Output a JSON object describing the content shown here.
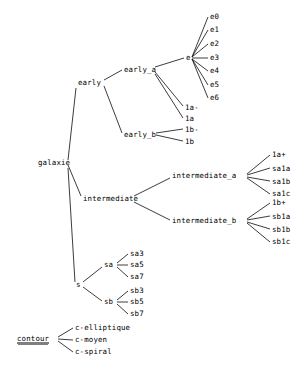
{
  "diagram": {
    "type": "node-link-tree",
    "orientation": "left-to-right",
    "background_color": "#ffffff",
    "edge_color": "#1a1a1a",
    "text_color": "#000000",
    "width": 304,
    "height": 375
  },
  "nodes": [
    {
      "id": "galaxie",
      "label": "galaxie",
      "x": 38,
      "y": 163,
      "anchor": "start",
      "underlined": false
    },
    {
      "id": "early",
      "label": "early",
      "x": 78,
      "y": 83,
      "anchor": "start",
      "underlined": false
    },
    {
      "id": "early_a",
      "label": "early_a",
      "x": 124,
      "y": 70,
      "anchor": "start",
      "underlined": false
    },
    {
      "id": "early_b",
      "label": "early_b",
      "x": 124,
      "y": 135,
      "anchor": "start",
      "underlined": false
    },
    {
      "id": "e",
      "label": "e",
      "x": 186,
      "y": 58,
      "anchor": "start",
      "underlined": false
    },
    {
      "id": "e0",
      "label": "e0",
      "x": 210,
      "y": 17,
      "anchor": "start",
      "underlined": false
    },
    {
      "id": "e1",
      "label": "e1",
      "x": 210,
      "y": 30,
      "anchor": "start",
      "underlined": false
    },
    {
      "id": "e2",
      "label": "e2",
      "x": 210,
      "y": 44,
      "anchor": "start",
      "underlined": false
    },
    {
      "id": "e3",
      "label": "e3",
      "x": 210,
      "y": 58,
      "anchor": "start",
      "underlined": false
    },
    {
      "id": "e4",
      "label": "e4",
      "x": 210,
      "y": 71,
      "anchor": "start",
      "underlined": false
    },
    {
      "id": "e5",
      "label": "e5",
      "x": 210,
      "y": 85,
      "anchor": "start",
      "underlined": false
    },
    {
      "id": "e6",
      "label": "e6",
      "x": 210,
      "y": 98,
      "anchor": "start",
      "underlined": false
    },
    {
      "id": "1a-",
      "label": "1a-",
      "x": 185,
      "y": 108,
      "anchor": "start",
      "underlined": false
    },
    {
      "id": "1a",
      "label": "1a",
      "x": 185,
      "y": 119,
      "anchor": "start",
      "underlined": false
    },
    {
      "id": "1b-",
      "label": "1b-",
      "x": 185,
      "y": 130,
      "anchor": "start",
      "underlined": false
    },
    {
      "id": "1b",
      "label": "1b",
      "x": 185,
      "y": 142,
      "anchor": "start",
      "underlined": false
    },
    {
      "id": "intermediate",
      "label": "intermediate",
      "x": 83,
      "y": 199,
      "anchor": "start",
      "underlined": false
    },
    {
      "id": "intermediate_a",
      "label": "intermediate_a",
      "x": 172,
      "y": 176,
      "anchor": "start",
      "underlined": false
    },
    {
      "id": "intermediate_b",
      "label": "intermediate_b",
      "x": 172,
      "y": 221,
      "anchor": "start",
      "underlined": false
    },
    {
      "id": "1a+",
      "label": "1a+",
      "x": 272,
      "y": 155,
      "anchor": "start",
      "underlined": false
    },
    {
      "id": "sa1a",
      "label": "sa1a",
      "x": 272,
      "y": 169,
      "anchor": "start",
      "underlined": false
    },
    {
      "id": "sa1b",
      "label": "sa1b",
      "x": 272,
      "y": 182,
      "anchor": "start",
      "underlined": false
    },
    {
      "id": "sa1c",
      "label": "sa1c",
      "x": 272,
      "y": 194,
      "anchor": "start",
      "underlined": false
    },
    {
      "id": "1b+",
      "label": "1b+",
      "x": 272,
      "y": 203,
      "anchor": "start",
      "underlined": false
    },
    {
      "id": "sb1a",
      "label": "sb1a",
      "x": 272,
      "y": 217,
      "anchor": "start",
      "underlined": false
    },
    {
      "id": "sb1b",
      "label": "sb1b",
      "x": 272,
      "y": 230,
      "anchor": "start",
      "underlined": false
    },
    {
      "id": "sb1c",
      "label": "sb1c",
      "x": 272,
      "y": 242,
      "anchor": "start",
      "underlined": false
    },
    {
      "id": "s",
      "label": "s",
      "x": 76,
      "y": 285,
      "anchor": "start",
      "underlined": false
    },
    {
      "id": "sa",
      "label": "sa",
      "x": 104,
      "y": 265,
      "anchor": "start",
      "underlined": false
    },
    {
      "id": "sb",
      "label": "sb",
      "x": 104,
      "y": 302,
      "anchor": "start",
      "underlined": false
    },
    {
      "id": "sa3",
      "label": "sa3",
      "x": 130,
      "y": 254,
      "anchor": "start",
      "underlined": false
    },
    {
      "id": "sa5",
      "label": "sa5",
      "x": 130,
      "y": 265,
      "anchor": "start",
      "underlined": false
    },
    {
      "id": "sa7",
      "label": "sa7",
      "x": 130,
      "y": 277,
      "anchor": "start",
      "underlined": false
    },
    {
      "id": "sb3",
      "label": "sb3",
      "x": 130,
      "y": 291,
      "anchor": "start",
      "underlined": false
    },
    {
      "id": "sb5",
      "label": "sb5",
      "x": 130,
      "y": 302,
      "anchor": "start",
      "underlined": false
    },
    {
      "id": "sb7",
      "label": "sb7",
      "x": 130,
      "y": 314,
      "anchor": "start",
      "underlined": false
    },
    {
      "id": "contour",
      "label": "contour",
      "x": 17,
      "y": 339,
      "anchor": "start",
      "underlined": true
    },
    {
      "id": "c-elliptique",
      "label": "c-elliptique",
      "x": 75,
      "y": 328,
      "anchor": "start",
      "underlined": false
    },
    {
      "id": "c-moyen",
      "label": "c-moyen",
      "x": 75,
      "y": 340,
      "anchor": "start",
      "underlined": false
    },
    {
      "id": "c-spiral",
      "label": "c-spiral",
      "x": 75,
      "y": 352,
      "anchor": "start",
      "underlined": false
    }
  ],
  "edges": [
    {
      "from": "galaxie",
      "to": "early",
      "x1": 68,
      "y1": 160,
      "x2": 76,
      "y2": 88
    },
    {
      "from": "galaxie",
      "to": "intermediate",
      "x1": 68,
      "y1": 165,
      "x2": 81,
      "y2": 196
    },
    {
      "from": "galaxie",
      "to": "s",
      "x1": 68,
      "y1": 168,
      "x2": 75,
      "y2": 282
    },
    {
      "from": "early",
      "to": "early_a",
      "x1": 104,
      "y1": 80,
      "x2": 122,
      "y2": 70
    },
    {
      "from": "early",
      "to": "early_b",
      "x1": 104,
      "y1": 86,
      "x2": 122,
      "y2": 133
    },
    {
      "from": "early_a",
      "to": "e",
      "x1": 155,
      "y1": 67,
      "x2": 184,
      "y2": 58
    },
    {
      "from": "early_a",
      "to": "1a-",
      "x1": 155,
      "y1": 72,
      "x2": 183,
      "y2": 106
    },
    {
      "from": "early_a",
      "to": "1a",
      "x1": 155,
      "y1": 74,
      "x2": 183,
      "y2": 118
    },
    {
      "from": "e",
      "to": "e0",
      "x1": 192,
      "y1": 57,
      "x2": 208,
      "y2": 17
    },
    {
      "from": "e",
      "to": "e1",
      "x1": 192,
      "y1": 57,
      "x2": 208,
      "y2": 30
    },
    {
      "from": "e",
      "to": "e2",
      "x1": 192,
      "y1": 57,
      "x2": 208,
      "y2": 44
    },
    {
      "from": "e",
      "to": "e3",
      "x1": 192,
      "y1": 58,
      "x2": 208,
      "y2": 58
    },
    {
      "from": "e",
      "to": "e4",
      "x1": 192,
      "y1": 59,
      "x2": 208,
      "y2": 71
    },
    {
      "from": "e",
      "to": "e5",
      "x1": 192,
      "y1": 59,
      "x2": 208,
      "y2": 85
    },
    {
      "from": "e",
      "to": "e6",
      "x1": 192,
      "y1": 59,
      "x2": 208,
      "y2": 98
    },
    {
      "from": "early_b",
      "to": "1b-",
      "x1": 156,
      "y1": 133,
      "x2": 183,
      "y2": 129
    },
    {
      "from": "early_b",
      "to": "1b",
      "x1": 156,
      "y1": 135,
      "x2": 183,
      "y2": 141
    },
    {
      "from": "intermediate",
      "to": "intermediate_a",
      "x1": 134,
      "y1": 196,
      "x2": 170,
      "y2": 178
    },
    {
      "from": "intermediate",
      "to": "intermediate_b",
      "x1": 134,
      "y1": 202,
      "x2": 170,
      "y2": 220
    },
    {
      "from": "intermediate_a",
      "to": "1a+",
      "x1": 247,
      "y1": 174,
      "x2": 270,
      "y2": 155
    },
    {
      "from": "intermediate_a",
      "to": "sa1a",
      "x1": 247,
      "y1": 175,
      "x2": 270,
      "y2": 168
    },
    {
      "from": "intermediate_a",
      "to": "sa1b",
      "x1": 247,
      "y1": 177,
      "x2": 270,
      "y2": 181
    },
    {
      "from": "intermediate_a",
      "to": "sa1c",
      "x1": 247,
      "y1": 178,
      "x2": 270,
      "y2": 194
    },
    {
      "from": "intermediate_b",
      "to": "1b+",
      "x1": 247,
      "y1": 219,
      "x2": 270,
      "y2": 203
    },
    {
      "from": "intermediate_b",
      "to": "sb1a",
      "x1": 247,
      "y1": 220,
      "x2": 270,
      "y2": 216
    },
    {
      "from": "intermediate_b",
      "to": "sb1b",
      "x1": 247,
      "y1": 222,
      "x2": 270,
      "y2": 229
    },
    {
      "from": "intermediate_b",
      "to": "sb1c",
      "x1": 247,
      "y1": 223,
      "x2": 270,
      "y2": 242
    },
    {
      "from": "s",
      "to": "sa",
      "x1": 83,
      "y1": 282,
      "x2": 102,
      "y2": 267
    },
    {
      "from": "s",
      "to": "sb",
      "x1": 83,
      "y1": 287,
      "x2": 102,
      "y2": 301
    },
    {
      "from": "sa",
      "to": "sa3",
      "x1": 117,
      "y1": 263,
      "x2": 128,
      "y2": 254
    },
    {
      "from": "sa",
      "to": "sa5",
      "x1": 117,
      "y1": 265,
      "x2": 128,
      "y2": 265
    },
    {
      "from": "sa",
      "to": "sa7",
      "x1": 117,
      "y1": 267,
      "x2": 128,
      "y2": 277
    },
    {
      "from": "sb",
      "to": "sb3",
      "x1": 117,
      "y1": 300,
      "x2": 128,
      "y2": 291
    },
    {
      "from": "sb",
      "to": "sb5",
      "x1": 117,
      "y1": 302,
      "x2": 128,
      "y2": 302
    },
    {
      "from": "sb",
      "to": "sb7",
      "x1": 117,
      "y1": 304,
      "x2": 128,
      "y2": 314
    },
    {
      "from": "contour",
      "to": "c-elliptique",
      "x1": 58,
      "y1": 337,
      "x2": 73,
      "y2": 328
    },
    {
      "from": "contour",
      "to": "c-moyen",
      "x1": 58,
      "y1": 339,
      "x2": 73,
      "y2": 340
    },
    {
      "from": "contour",
      "to": "c-spiral",
      "x1": 58,
      "y1": 341,
      "x2": 73,
      "y2": 352
    }
  ]
}
